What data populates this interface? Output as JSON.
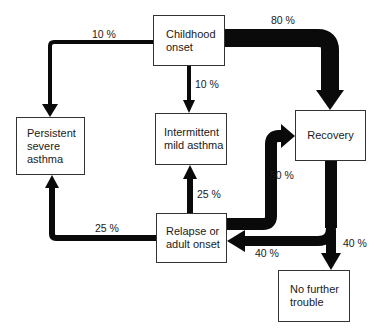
{
  "diagram": {
    "type": "flow",
    "nodes": [
      {
        "id": "childhood",
        "label": "Childhood\nonset"
      },
      {
        "id": "persistent",
        "label": "Persistent\nsevere\nasthma"
      },
      {
        "id": "intermittent",
        "label": "Intermittent\nmild asthma"
      },
      {
        "id": "recovery",
        "label": "Recovery"
      },
      {
        "id": "relapse",
        "label": "Relapse or\nadult onset"
      },
      {
        "id": "no_trouble",
        "label": "No further\ntrouble"
      }
    ],
    "edges": [
      {
        "from": "childhood",
        "to": "persistent",
        "label": "10 %"
      },
      {
        "from": "childhood",
        "to": "intermittent",
        "label": "10 %"
      },
      {
        "from": "childhood",
        "to": "recovery",
        "label": "80 %"
      },
      {
        "from": "relapse",
        "to": "intermittent",
        "label": "25 %"
      },
      {
        "from": "relapse",
        "to": "persistent",
        "label": "25 %"
      },
      {
        "from": "relapse",
        "to": "recovery",
        "label": "50 %"
      },
      {
        "from": "recovery",
        "to": "relapse",
        "label": "40 %"
      },
      {
        "from": "recovery",
        "to": "no_trouble",
        "label": "40 %"
      }
    ]
  },
  "colors": {
    "arrow": "#0a0a0a",
    "box_border": "#333333",
    "background": "#ffffff"
  }
}
